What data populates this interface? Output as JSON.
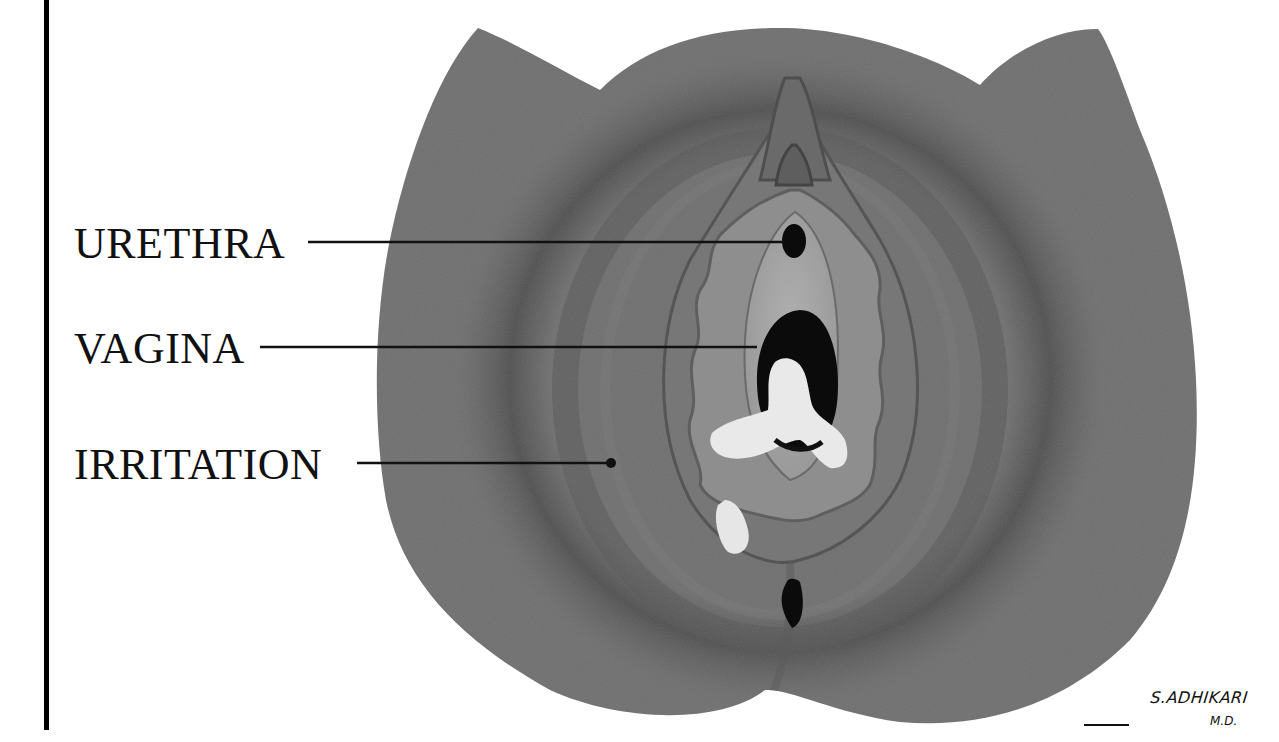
{
  "figure": {
    "type": "medical illustration",
    "palette": {
      "skin": "#6e6e6e",
      "skin_shadow": "#4e4e4e",
      "labia_outer": "#7f7f7f",
      "labia_inner": "#8e8e8e",
      "vestibule": "#a3a3a3",
      "opening": "#0b0b0b",
      "discharge": "#e9e9e9",
      "text": "#111111",
      "rule": "#000000"
    }
  },
  "labels": [
    {
      "id": "urethra",
      "text": "URETHRA",
      "line_y": 242,
      "target": [
        785,
        242
      ]
    },
    {
      "id": "vagina",
      "text": "VAGINA",
      "line_y": 347,
      "target": [
        757,
        347
      ]
    },
    {
      "id": "irritation",
      "text": "IRRITATION",
      "line_y": 463,
      "target": [
        611,
        463
      ]
    }
  ],
  "signature": {
    "name": "S.ADHIKARI",
    "credential": "M.D."
  }
}
